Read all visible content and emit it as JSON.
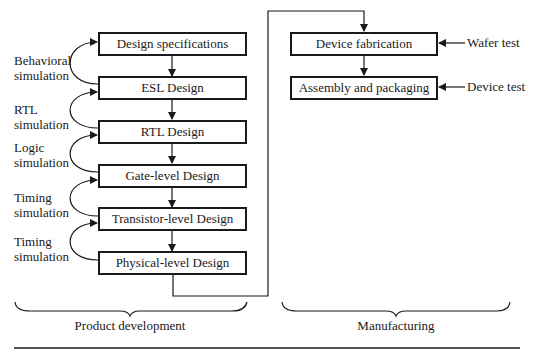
{
  "product_development": {
    "label": "Product development",
    "steps": [
      {
        "label": "Design specifications"
      },
      {
        "label": "ESL Design"
      },
      {
        "label": "RTL Design"
      },
      {
        "label": "Gate-level Design"
      },
      {
        "label": "Transistor-level Design"
      },
      {
        "label": "Physical-level Design"
      }
    ],
    "simulations": [
      {
        "line1": "Behavioral",
        "line2": "simulation"
      },
      {
        "line1": "RTL",
        "line2": "simulation"
      },
      {
        "line1": "Logic",
        "line2": "simulation"
      },
      {
        "line1": "Timing",
        "line2": "simulation"
      },
      {
        "line1": "Timing",
        "line2": "simulation"
      }
    ]
  },
  "manufacturing": {
    "label": "Manufacturing",
    "steps": [
      {
        "label": "Device fabrication",
        "test": "Wafer test"
      },
      {
        "label": "Assembly and packaging",
        "test": "Device test"
      }
    ]
  }
}
